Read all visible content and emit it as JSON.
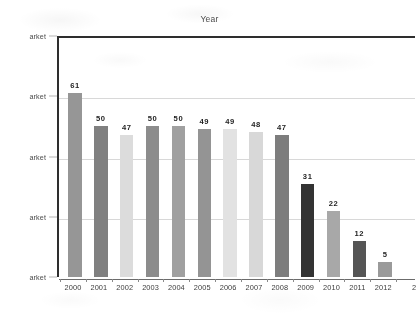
{
  "chart_data": {
    "type": "bar",
    "title": "Year",
    "xlabel": "",
    "ylabel": "arket",
    "categories": [
      "2000",
      "2001",
      "2002",
      "2003",
      "2004",
      "2005",
      "2006",
      "2007",
      "2008",
      "2009",
      "2010",
      "2011",
      "2012"
    ],
    "values": [
      61,
      50,
      47,
      50,
      50,
      49,
      49,
      48,
      47,
      31,
      22,
      12,
      5
    ],
    "bar_colors": [
      "#969696",
      "#808080",
      "#dcdcdc",
      "#8c8c8c",
      "#a0a0a0",
      "#949494",
      "#e2e2e2",
      "#d8d8d8",
      "#7d7d7d",
      "#333333",
      "#a8a8a8",
      "#555555",
      "#9a9a9a"
    ],
    "ylim": [
      0,
      80
    ],
    "yticks": [
      0,
      20,
      40,
      60,
      80
    ],
    "ytick_labels": [
      "arket",
      "arket",
      "arket",
      "arket",
      "arket"
    ],
    "grid": true,
    "legend": false,
    "legend_position": "none",
    "clipped_x_label_right": "2"
  },
  "axes": {
    "title_label": "Year",
    "y_axis_name": "arket",
    "x_axis_name": ""
  },
  "colors": {
    "plot_border": "#2e2e2e",
    "gridline": "#d8d8d8",
    "baseline": "#6b6b6b",
    "background": "#ffffff",
    "value_label": "#1e1e1e"
  }
}
